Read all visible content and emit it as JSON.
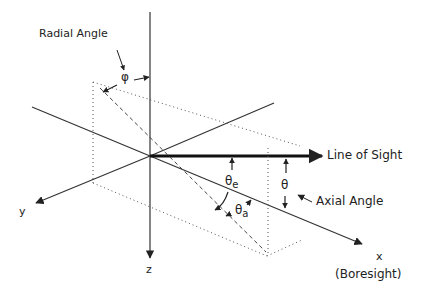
{
  "diagram": {
    "labels": {
      "radial_angle": "Radial Angle",
      "phi": "φ",
      "line_of_sight": "Line of Sight",
      "theta_e": "θ",
      "theta_e_sub": "e",
      "theta_a": "θ",
      "theta_a_sub": "a",
      "theta": "θ",
      "axial_angle": "Axial Angle",
      "y_axis": "y",
      "z_axis": "z",
      "x_axis": "x",
      "boresight": "(Boresight)"
    },
    "colors": {
      "line": "#222222",
      "background": "#ffffff"
    }
  }
}
